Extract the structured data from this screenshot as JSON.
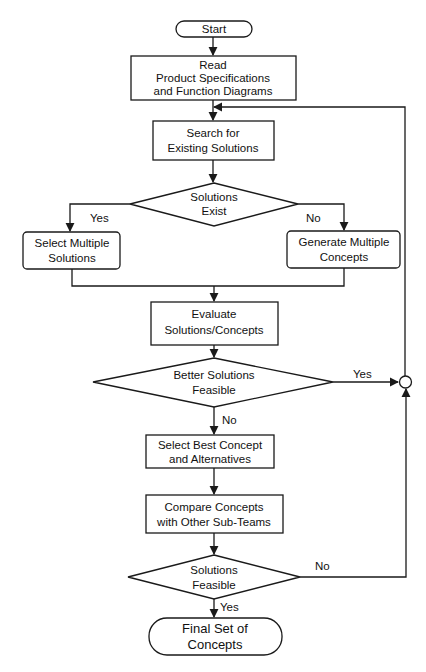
{
  "diagram": {
    "type": "flowchart",
    "nodes": {
      "start": {
        "shape": "terminator",
        "lines": [
          "Start"
        ]
      },
      "read": {
        "shape": "process",
        "lines": [
          "Read",
          "Product Specifications",
          "and Function Diagrams"
        ]
      },
      "search": {
        "shape": "process",
        "lines": [
          "Search for",
          "Existing Solutions"
        ]
      },
      "exist": {
        "shape": "decision",
        "lines": [
          "Solutions",
          "Exist"
        ]
      },
      "select_multiple": {
        "shape": "process-rounded",
        "lines": [
          "Select Multiple",
          "Solutions"
        ]
      },
      "generate_multiple": {
        "shape": "process-rounded",
        "lines": [
          "Generate Multiple",
          "Concepts"
        ]
      },
      "evaluate": {
        "shape": "process",
        "lines": [
          "Evaluate",
          "Solutions/Concepts"
        ]
      },
      "better": {
        "shape": "decision",
        "lines": [
          "Better Solutions",
          "Feasible"
        ]
      },
      "select_best": {
        "shape": "process",
        "lines": [
          "Select Best Concept",
          "and Alternatives"
        ]
      },
      "compare": {
        "shape": "process",
        "lines": [
          "Compare Concepts",
          "with Other Sub-Teams"
        ]
      },
      "feasible": {
        "shape": "decision",
        "lines": [
          "Solutions",
          "Feasible"
        ]
      },
      "final": {
        "shape": "terminator",
        "lines": [
          "Final Set of",
          "Concepts"
        ]
      },
      "junction": {
        "shape": "connector",
        "lines": []
      }
    },
    "edge_labels": {
      "exist_yes": "Yes",
      "exist_no": "No",
      "better_yes": "Yes",
      "better_no": "No",
      "feasible_no": "No",
      "feasible_yes": "Yes"
    },
    "edges": [
      {
        "from": "start",
        "to": "read"
      },
      {
        "from": "read",
        "to": "search"
      },
      {
        "from": "search",
        "to": "exist"
      },
      {
        "from": "exist",
        "to": "select_multiple",
        "label": "Yes"
      },
      {
        "from": "exist",
        "to": "generate_multiple",
        "label": "No"
      },
      {
        "from": "select_multiple",
        "to": "evaluate"
      },
      {
        "from": "generate_multiple",
        "to": "evaluate"
      },
      {
        "from": "evaluate",
        "to": "better"
      },
      {
        "from": "better",
        "to": "junction",
        "label": "Yes"
      },
      {
        "from": "better",
        "to": "select_best",
        "label": "No"
      },
      {
        "from": "select_best",
        "to": "compare"
      },
      {
        "from": "compare",
        "to": "feasible"
      },
      {
        "from": "feasible",
        "to": "junction",
        "label": "No"
      },
      {
        "from": "feasible",
        "to": "final",
        "label": "Yes"
      },
      {
        "from": "junction",
        "to": "search"
      }
    ]
  }
}
